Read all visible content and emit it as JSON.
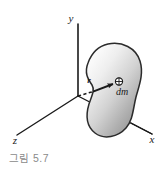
{
  "figure": {
    "caption": "그림 5.7",
    "axes": {
      "y_label": "y",
      "x_label": "x",
      "z_label": "z"
    },
    "annotations": {
      "vector_label": "r",
      "mass_element_label": "dm"
    },
    "colors": {
      "background": "#ffffff",
      "axis_line": "#1a1a1a",
      "body_outline": "#2b2b2b",
      "body_fill_light": "#f2f2f2",
      "body_fill_mid": "#c9c9c9",
      "body_fill_dark": "#9a9a9a",
      "caption_text": "#8a8a8a",
      "label_text": "#1a1a1a"
    }
  }
}
